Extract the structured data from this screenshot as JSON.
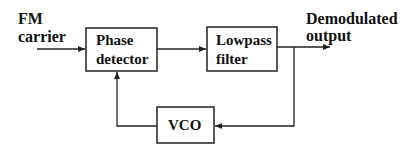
{
  "diagram": {
    "colors": {
      "line": "#222222",
      "text": "#111111",
      "background": "#ffffff"
    },
    "inputs": [
      {
        "id": "fm_carrier",
        "line1": "FM",
        "line2": "carrier"
      }
    ],
    "outputs": [
      {
        "id": "demod_out",
        "line1": "Demodulated",
        "line2": "output"
      }
    ],
    "blocks": [
      {
        "id": "phase_detector",
        "line1": "Phase",
        "line2": "detector"
      },
      {
        "id": "lowpass_filter",
        "line1": "Lowpass",
        "line2": "filter"
      },
      {
        "id": "vco",
        "line1": "VCO"
      }
    ],
    "edges": [
      {
        "from": "fm_carrier",
        "to": "phase_detector"
      },
      {
        "from": "phase_detector",
        "to": "lowpass_filter"
      },
      {
        "from": "lowpass_filter",
        "to": "demod_out"
      },
      {
        "from": "lowpass_filter",
        "to": "vco",
        "note": "feedback branch"
      },
      {
        "from": "vco",
        "to": "phase_detector"
      }
    ]
  }
}
